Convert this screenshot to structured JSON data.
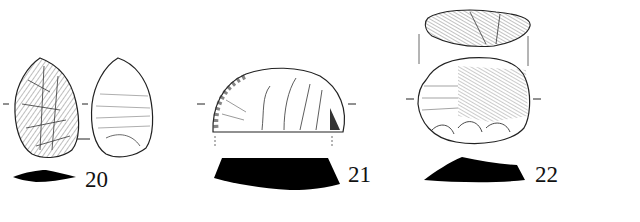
{
  "figure": {
    "artifacts": [
      {
        "id": "20",
        "label": "20",
        "views": [
          "dorsal",
          "ventral",
          "section"
        ]
      },
      {
        "id": "21",
        "label": "21",
        "views": [
          "dorsal",
          "section"
        ]
      },
      {
        "id": "22",
        "label": "22",
        "views": [
          "profile",
          "dorsal",
          "section"
        ]
      }
    ],
    "colors": {
      "line": "#222222",
      "section_fill": "#000000",
      "background": "#ffffff"
    }
  }
}
